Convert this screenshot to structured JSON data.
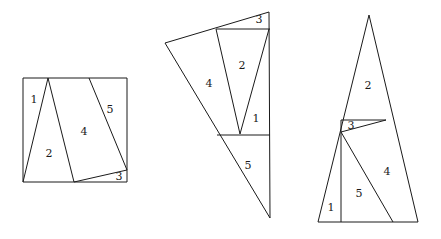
{
  "figure": {
    "background_color": "#ffffff",
    "line_color": "#1a1a1a",
    "label_color": "#1a1a1a",
    "width": 441,
    "height": 239,
    "piece_count_per_figure": 5
  },
  "figures": [
    {
      "id": "square-dissection",
      "name": "square",
      "outline_name": "square-outline",
      "outline_points": "23,78 127,78 127,182 23,182",
      "cuts": [
        {
          "name": "cut-apex-to-bottom-left",
          "points": "48,78 23,182"
        },
        {
          "name": "cut-apex-to-bottom-mid",
          "points": "48,78 74,182"
        },
        {
          "name": "cut-top-to-right-edge",
          "points": "89,78 127,170"
        },
        {
          "name": "cut-bottom-mid-to-right-edge",
          "points": "74,182 127,170"
        }
      ],
      "labels": [
        {
          "name": "region-label-1",
          "text": "1",
          "x": 34,
          "y": 100
        },
        {
          "name": "region-label-2",
          "text": "2",
          "x": 49,
          "y": 154
        },
        {
          "name": "region-label-3",
          "text": "3",
          "x": 119,
          "y": 177
        },
        {
          "name": "region-label-4",
          "text": "4",
          "x": 84,
          "y": 132
        },
        {
          "name": "region-label-5",
          "text": "5",
          "x": 110,
          "y": 110
        }
      ]
    },
    {
      "id": "scalene-triangle-dissection",
      "name": "scalene triangle",
      "outline_name": "scalene-triangle-outline",
      "outline_points": "269,12 270,218 165,43",
      "cuts": [
        {
          "name": "cut-upper-horizontal",
          "points": "216,29 270,29"
        },
        {
          "name": "cut-lower-horizontal",
          "points": "217,135 270,135"
        },
        {
          "name": "cut-left-spike",
          "points": "216,29 240,134"
        },
        {
          "name": "cut-right-spike",
          "points": "269,29 240,134"
        }
      ],
      "labels": [
        {
          "name": "region-label-1",
          "text": "1",
          "x": 256,
          "y": 119
        },
        {
          "name": "region-label-2",
          "text": "2",
          "x": 242,
          "y": 66
        },
        {
          "name": "region-label-3",
          "text": "3",
          "x": 259,
          "y": 20
        },
        {
          "name": "region-label-4",
          "text": "4",
          "x": 209,
          "y": 84
        },
        {
          "name": "region-label-5",
          "text": "5",
          "x": 248,
          "y": 166
        }
      ]
    },
    {
      "id": "tall-triangle-dissection",
      "name": "tall triangle",
      "outline_name": "tall-triangle-outline",
      "outline_points": "369,15 418,222 318,222",
      "cuts": [
        {
          "name": "cut-horizontal-band",
          "points": "341,120 386,120"
        },
        {
          "name": "cut-vertical",
          "points": "341,120 341,222"
        },
        {
          "name": "cut-small-triangle-diagonal",
          "points": "341,132 386,120"
        },
        {
          "name": "cut-diagonal-to-base",
          "points": "341,132 393,222"
        }
      ],
      "labels": [
        {
          "name": "region-label-1",
          "text": "1",
          "x": 331,
          "y": 208
        },
        {
          "name": "region-label-2",
          "text": "2",
          "x": 368,
          "y": 86
        },
        {
          "name": "region-label-3",
          "text": "3",
          "x": 351,
          "y": 126
        },
        {
          "name": "region-label-4",
          "text": "4",
          "x": 387,
          "y": 172
        },
        {
          "name": "region-label-5",
          "text": "5",
          "x": 359,
          "y": 194
        }
      ]
    }
  ]
}
